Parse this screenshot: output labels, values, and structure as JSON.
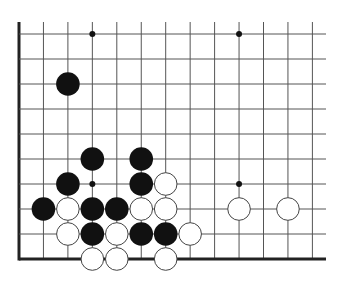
{
  "diagram": {
    "type": "go-board-fragment",
    "colors": {
      "background": "#ffffff",
      "line": "#555555",
      "edge": "#222222",
      "black": "#111111",
      "white": "#ffffff",
      "white_stroke": "#444444"
    },
    "grid": {
      "x0": 19,
      "dx": 24.45,
      "cols": 13,
      "y0": 34,
      "dy": 25,
      "rows": 10,
      "line_top": 22,
      "line_right": 326,
      "edges": [
        "left",
        "bottom"
      ]
    },
    "hoshi": [
      [
        3,
        0
      ],
      [
        9,
        0
      ],
      [
        3,
        6
      ],
      [
        9,
        6
      ]
    ],
    "stones": {
      "black": [
        [
          2,
          2
        ],
        [
          3,
          5
        ],
        [
          5,
          5
        ],
        [
          2,
          6
        ],
        [
          5,
          6
        ],
        [
          1,
          7
        ],
        [
          3,
          7
        ],
        [
          4,
          7
        ],
        [
          3,
          8
        ],
        [
          5,
          8
        ],
        [
          6,
          8
        ]
      ],
      "white": [
        [
          6,
          6
        ],
        [
          2,
          7
        ],
        [
          5,
          7
        ],
        [
          6,
          7
        ],
        [
          9,
          7
        ],
        [
          11,
          7
        ],
        [
          2,
          8
        ],
        [
          4,
          8
        ],
        [
          7,
          8
        ],
        [
          3,
          9
        ],
        [
          4,
          9
        ],
        [
          6,
          9
        ]
      ]
    }
  }
}
